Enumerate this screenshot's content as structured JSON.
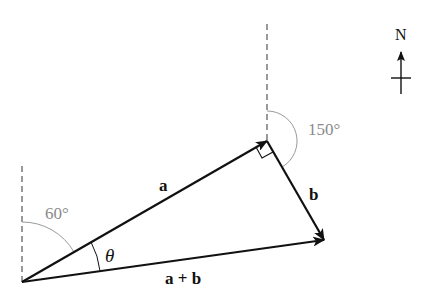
{
  "diagram": {
    "type": "vector-addition",
    "vectors": [
      {
        "id": "a",
        "label": "a",
        "from": [
          22,
          282
        ],
        "to": [
          267,
          141
        ]
      },
      {
        "id": "b",
        "label": "b",
        "from": [
          267,
          141
        ],
        "to": [
          324,
          240
        ]
      },
      {
        "id": "sum",
        "label": "a + b",
        "from": [
          22,
          282
        ],
        "to": [
          324,
          240
        ]
      }
    ],
    "angles": {
      "a_from_north": "60°",
      "b_from_north": "150°",
      "between": "θ"
    },
    "compass": {
      "label": "N"
    },
    "colors": {
      "vector": "#111111",
      "reference": "#555555",
      "angle_arc": "#999999",
      "angle_text": "#8a8a8a"
    }
  }
}
